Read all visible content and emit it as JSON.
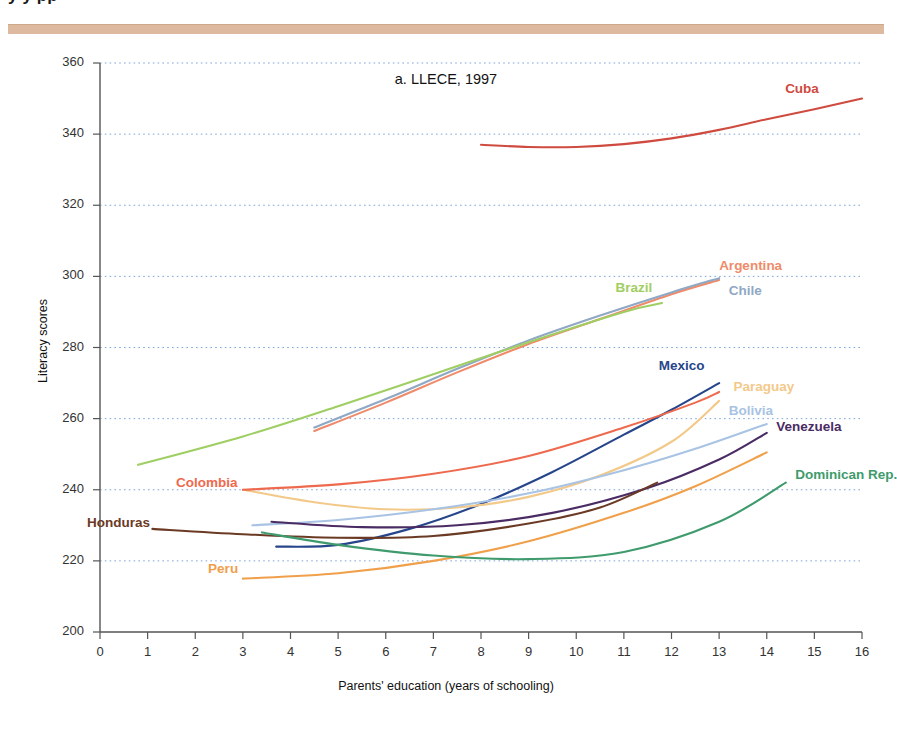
{
  "page": {
    "cropped_heading": "y                      y                         pp",
    "rule_color": "#dcb99f"
  },
  "figure": {
    "chart_title": "a. LLECE, 1997",
    "x_axis_title": "Parents' education (years of schooling)",
    "y_axis_title": "Literacy scores"
  },
  "chart_data": {
    "type": "line",
    "title": "a. LLECE, 1997",
    "xlabel": "Parents' education (years of schooling)",
    "ylabel": "Literacy scores",
    "xlim": [
      0,
      16
    ],
    "ylim": [
      200,
      360
    ],
    "xticks": [
      0,
      1,
      2,
      3,
      4,
      5,
      6,
      7,
      8,
      9,
      10,
      11,
      12,
      13,
      14,
      15,
      16
    ],
    "yticks": [
      200,
      220,
      240,
      260,
      280,
      300,
      320,
      340,
      360
    ],
    "grid": "horizontal dotted",
    "legend": "inline labels at curve ends",
    "series": [
      {
        "name": "Cuba",
        "color": "#cf4a3f",
        "label_x": 15.1,
        "label_y": 352.5,
        "label_anchor": "end",
        "x": [
          8,
          9,
          10,
          11,
          12,
          13,
          14,
          15,
          16
        ],
        "y": [
          337,
          336.4,
          336.4,
          337.2,
          338.8,
          341.2,
          344.2,
          347,
          350
        ]
      },
      {
        "name": "Argentina",
        "color": "#ef8b6a",
        "label_x": 13.0,
        "label_y": 302.5,
        "label_anchor": "start",
        "x": [
          4.5,
          6,
          7.5,
          9,
          10.5,
          12,
          13
        ],
        "y": [
          256.5,
          264.5,
          273,
          281,
          288,
          295,
          299
        ]
      },
      {
        "name": "Chile",
        "color": "#8fa8c4",
        "label_x": 13.2,
        "label_y": 295.5,
        "label_anchor": "start",
        "x": [
          4.5,
          6,
          7.5,
          9,
          10.5,
          12,
          13
        ],
        "y": [
          257.5,
          265.5,
          274,
          282,
          289,
          295.5,
          299.5
        ]
      },
      {
        "name": "Brazil",
        "color": "#9fce63",
        "label_x": 11.6,
        "label_y": 296.5,
        "label_anchor": "end",
        "x": [
          0.8,
          3,
          5,
          7,
          9,
          11,
          11.8
        ],
        "y": [
          247,
          255,
          263.5,
          272.5,
          281.5,
          290,
          292.5
        ]
      },
      {
        "name": "Mexico",
        "color": "#26458a",
        "label_x": 12.7,
        "label_y": 274.5,
        "label_anchor": "end",
        "x": [
          3.7,
          5,
          6.5,
          8,
          9.5,
          11,
          12,
          13
        ],
        "y": [
          224,
          224.5,
          229,
          236,
          245,
          255.5,
          262.5,
          270
        ]
      },
      {
        "name": "Paraguay",
        "color": "#f3c98a",
        "label_x": 13.3,
        "label_y": 268.5,
        "label_anchor": "start",
        "x": [
          3,
          4.5,
          6,
          7.5,
          9,
          10.5,
          12,
          13
        ],
        "y": [
          240,
          236.5,
          234.5,
          235,
          238,
          244,
          253.5,
          265
        ]
      },
      {
        "name": "Bolivia",
        "color": "#a8c3e3",
        "label_x": 13.2,
        "label_y": 262.0,
        "label_anchor": "start",
        "x": [
          3.2,
          5,
          7,
          9,
          11,
          12.5,
          14
        ],
        "y": [
          230,
          231.5,
          234.5,
          239,
          245.5,
          251.5,
          258.5
        ]
      },
      {
        "name": "Venezuela",
        "color": "#4a2b63",
        "label_x": 14.2,
        "label_y": 257.5,
        "label_anchor": "start",
        "x": [
          3.6,
          5.5,
          7.5,
          9.5,
          11.5,
          13,
          14
        ],
        "y": [
          231,
          229.5,
          230,
          233.5,
          240.5,
          248.5,
          256
        ]
      },
      {
        "name": "Colombia",
        "color": "#ee6a4e",
        "label_x": 2.9,
        "label_y": 241.5,
        "label_anchor": "end",
        "x": [
          3,
          5,
          7,
          9,
          11,
          12.5,
          13
        ],
        "y": [
          240,
          241.5,
          244.5,
          249.5,
          257.5,
          264.5,
          267.5
        ]
      },
      {
        "name": "Honduras",
        "color": "#6b3a25",
        "label_x": 1.05,
        "label_y": 230.5,
        "label_anchor": "end",
        "x": [
          1.1,
          3,
          5,
          7,
          9,
          10.5,
          11.7
        ],
        "y": [
          229,
          227.5,
          226.5,
          227,
          230.5,
          235,
          242
        ]
      },
      {
        "name": "Peru",
        "color": "#f0a04b",
        "label_x": 2.9,
        "label_y": 217.5,
        "label_anchor": "end",
        "x": [
          3,
          5,
          7,
          9,
          11,
          12.5,
          14
        ],
        "y": [
          215,
          216.5,
          220,
          225.5,
          233.5,
          241,
          250.5
        ]
      },
      {
        "name": "Dominican Rep.",
        "color": "#3f9b6d",
        "label_x": 14.6,
        "label_y": 244.0,
        "label_anchor": "start",
        "x": [
          3.4,
          5,
          7,
          9,
          11,
          13,
          14.4
        ],
        "y": [
          228,
          224.5,
          221.5,
          220.5,
          222.5,
          231,
          242
        ]
      }
    ]
  }
}
